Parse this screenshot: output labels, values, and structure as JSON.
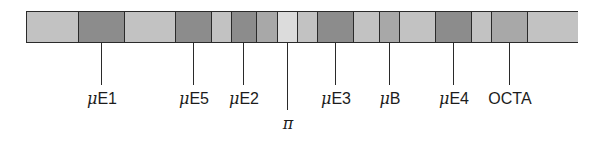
{
  "diagram": {
    "type": "linear-segment-map",
    "colors": {
      "light": "#c2c2c2",
      "dark": "#8c8c8c",
      "medium": "#a8a8a8",
      "very_light": "#dcdcdc",
      "line": "#2a2a2a"
    },
    "segments": [
      {
        "start": 26,
        "end": 78,
        "shade": "light"
      },
      {
        "start": 78,
        "end": 124,
        "shade": "dark"
      },
      {
        "start": 124,
        "end": 175,
        "shade": "light"
      },
      {
        "start": 175,
        "end": 211,
        "shade": "dark"
      },
      {
        "start": 211,
        "end": 231,
        "shade": "light"
      },
      {
        "start": 231,
        "end": 256,
        "shade": "dark"
      },
      {
        "start": 256,
        "end": 277,
        "shade": "medium"
      },
      {
        "start": 277,
        "end": 297,
        "shade": "very_light"
      },
      {
        "start": 297,
        "end": 317,
        "shade": "light"
      },
      {
        "start": 317,
        "end": 353,
        "shade": "dark"
      },
      {
        "start": 353,
        "end": 379,
        "shade": "light"
      },
      {
        "start": 379,
        "end": 399,
        "shade": "medium"
      },
      {
        "start": 399,
        "end": 435,
        "shade": "light"
      },
      {
        "start": 435,
        "end": 471,
        "shade": "dark"
      },
      {
        "start": 471,
        "end": 491,
        "shade": "light"
      },
      {
        "start": 491,
        "end": 527,
        "shade": "medium"
      },
      {
        "start": 527,
        "end": 578,
        "shade": "light"
      }
    ],
    "labels": [
      {
        "prefix": "μ",
        "text": "E1",
        "x": 101,
        "line_end": 85,
        "label_top": 91
      },
      {
        "prefix": "μ",
        "text": "E5",
        "x": 193,
        "line_end": 85,
        "label_top": 91
      },
      {
        "prefix": "μ",
        "text": "E2",
        "x": 243,
        "line_end": 85,
        "label_top": 91
      },
      {
        "prefix": "",
        "text": "π",
        "x": 287,
        "line_end": 110,
        "label_top": 116,
        "italic": true
      },
      {
        "prefix": "μ",
        "text": "E3",
        "x": 335,
        "line_end": 85,
        "label_top": 91
      },
      {
        "prefix": "μ",
        "text": "B",
        "x": 389,
        "line_end": 85,
        "label_top": 91
      },
      {
        "prefix": "μ",
        "text": "E4",
        "x": 453,
        "line_end": 85,
        "label_top": 91
      },
      {
        "prefix": "",
        "text": "OCTA",
        "x": 509,
        "line_end": 85,
        "label_top": 91
      }
    ]
  }
}
